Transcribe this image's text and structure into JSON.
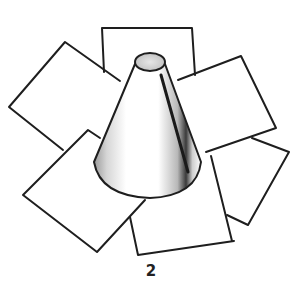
{
  "figure": {
    "label": "2",
    "colors": {
      "stroke": "#1e1e1e",
      "paper": "#ffffff",
      "shade": "#7a7a7a",
      "top": "#cfcfcf"
    },
    "squares": [
      {
        "name": "top-square",
        "points": "102,28 192,28 195,75 180,80 150,60 108,70 104,72"
      },
      {
        "name": "upper-left-square",
        "points": "9,107 65,42 120,80 100,138 63,150"
      },
      {
        "name": "upper-right-square",
        "points": "178,80 241,56 276,128 206,152"
      },
      {
        "name": "lower-left-square",
        "points": "23,195 88,130 100,138 98,163 113,187 145,200 97,252"
      },
      {
        "name": "lower-right-square",
        "points": "212,157 252,140 289,152 248,225 232,215"
      },
      {
        "name": "bottom-square",
        "points": "130,217 146,198 191,193 210,170 225,157 234,241 138,255"
      }
    ]
  }
}
